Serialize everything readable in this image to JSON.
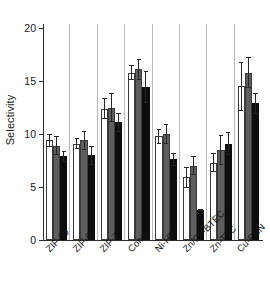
{
  "chart_data": {
    "type": "bar",
    "title": "",
    "subtitle": "",
    "xlabel": "",
    "ylabel": "Selectivity",
    "categories": [
      "ZIF-90",
      "ZIF-8",
      "ZIF-7",
      "Conic",
      "Ni-HF",
      "Zn/Co-BTEC",
      "Zn-TTC",
      "Cu-PCN"
    ],
    "series": [
      {
        "name": "series-1-open",
        "color": "#ffffff",
        "values": [
          9.4,
          9.1,
          12.4,
          15.8,
          9.8,
          5.9,
          7.3,
          14.5
        ],
        "errors": [
          0.6,
          0.5,
          1.0,
          0.7,
          0.7,
          1.0,
          0.9,
          2.3
        ]
      },
      {
        "name": "series-2-gray",
        "color": "#5e5e5e",
        "values": [
          8.9,
          9.4,
          12.5,
          16.1,
          10.0,
          7.0,
          8.5,
          15.8
        ],
        "errors": [
          0.9,
          0.9,
          1.4,
          1.0,
          0.9,
          0.9,
          1.4,
          1.5
        ]
      },
      {
        "name": "series-3-black",
        "color": "#0d0d0d",
        "values": [
          7.9,
          8.0,
          11.1,
          14.4,
          7.6,
          2.8,
          9.1,
          12.9
        ],
        "errors": [
          0.5,
          0.9,
          0.9,
          1.5,
          0.6,
          0.1,
          1.1,
          1.0
        ]
      }
    ],
    "yticks": [
      0,
      5,
      10,
      15,
      20
    ],
    "ytick_labels": [
      "0",
      "5",
      "10",
      "15",
      "20"
    ],
    "ylim": [
      0,
      22
    ],
    "grid": false,
    "legend": "none",
    "error_bar_style": "capped",
    "xtick_label_rotation": -45,
    "group_separators": true
  }
}
